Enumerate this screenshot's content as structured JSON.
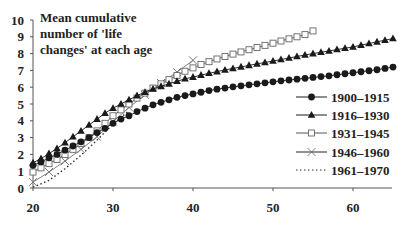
{
  "chart_data": {
    "type": "line",
    "title": "Mean cumulative number of 'life changes' at each age",
    "title_lines": [
      "Mean cumulative",
      "number of 'life",
      "changes' at each age"
    ],
    "xlabel": "",
    "ylabel": "",
    "xlim": [
      20,
      65
    ],
    "ylim": [
      0,
      10
    ],
    "x_ticks": [
      20,
      30,
      40,
      50,
      60
    ],
    "y_ticks": [
      0,
      1,
      2,
      3,
      4,
      5,
      6,
      7,
      8,
      9,
      10
    ],
    "grid": false,
    "legend_position": "right-middle",
    "series": [
      {
        "name": "1900–1915",
        "marker": "filled-circle",
        "color": "#1a1a1a",
        "x": [
          20,
          21,
          22,
          23,
          24,
          25,
          26,
          27,
          28,
          29,
          30,
          31,
          32,
          33,
          34,
          35,
          36,
          37,
          38,
          39,
          40,
          41,
          42,
          43,
          44,
          45,
          46,
          47,
          48,
          49,
          50,
          51,
          52,
          53,
          54,
          55,
          56,
          57,
          58,
          59,
          60,
          61,
          62,
          63,
          64,
          65
        ],
        "values": [
          1.35,
          1.55,
          1.8,
          2.0,
          2.25,
          2.5,
          2.75,
          3.0,
          3.3,
          3.55,
          3.85,
          4.1,
          4.3,
          4.55,
          4.75,
          4.95,
          5.1,
          5.25,
          5.4,
          5.5,
          5.6,
          5.7,
          5.8,
          5.88,
          5.95,
          6.02,
          6.08,
          6.14,
          6.2,
          6.26,
          6.32,
          6.38,
          6.43,
          6.48,
          6.53,
          6.58,
          6.63,
          6.68,
          6.74,
          6.8,
          6.86,
          6.92,
          6.98,
          7.04,
          7.12,
          7.2
        ]
      },
      {
        "name": "1916–1930",
        "marker": "filled-triangle",
        "color": "#1a1a1a",
        "x": [
          20,
          21,
          22,
          23,
          24,
          25,
          26,
          27,
          28,
          29,
          30,
          31,
          32,
          33,
          34,
          35,
          36,
          37,
          38,
          39,
          40,
          41,
          42,
          43,
          44,
          45,
          46,
          47,
          48,
          49,
          50,
          51,
          52,
          53,
          54,
          55,
          56,
          57,
          58,
          59,
          60,
          61,
          62,
          63,
          64,
          65
        ],
        "values": [
          1.5,
          1.75,
          2.05,
          2.35,
          2.7,
          3.05,
          3.4,
          3.75,
          4.1,
          4.45,
          4.75,
          5.0,
          5.25,
          5.5,
          5.7,
          5.9,
          6.05,
          6.2,
          6.35,
          6.5,
          6.6,
          6.72,
          6.83,
          6.93,
          7.03,
          7.12,
          7.21,
          7.3,
          7.39,
          7.47,
          7.56,
          7.65,
          7.74,
          7.83,
          7.92,
          8.0,
          8.08,
          8.16,
          8.24,
          8.32,
          8.4,
          8.5,
          8.6,
          8.7,
          8.8,
          8.9
        ]
      },
      {
        "name": "1931–1945",
        "marker": "open-square",
        "color": "#555555",
        "x": [
          20,
          21,
          22,
          23,
          24,
          25,
          26,
          27,
          28,
          29,
          30,
          31,
          32,
          33,
          34,
          35,
          36,
          37,
          38,
          39,
          40,
          41,
          42,
          43,
          44,
          45,
          46,
          47,
          48,
          49,
          50,
          51,
          52,
          53,
          54,
          55
        ],
        "values": [
          0.95,
          1.2,
          1.45,
          1.7,
          2.0,
          2.3,
          2.65,
          3.0,
          3.4,
          3.85,
          4.3,
          4.65,
          5.0,
          5.35,
          5.65,
          5.95,
          6.2,
          6.45,
          6.7,
          6.95,
          7.15,
          7.35,
          7.52,
          7.68,
          7.83,
          7.97,
          8.1,
          8.23,
          8.36,
          8.49,
          8.62,
          8.75,
          8.88,
          9.0,
          9.13,
          9.35
        ]
      },
      {
        "name": "1946–1960",
        "marker": "cross",
        "color": "#777777",
        "x": [
          20,
          22,
          24,
          26,
          28,
          30,
          32,
          34,
          36,
          38,
          40
        ],
        "values": [
          0.35,
          0.95,
          1.6,
          2.3,
          3.05,
          3.95,
          4.8,
          5.55,
          6.25,
          6.9,
          7.6
        ]
      },
      {
        "name": "1961–1970",
        "marker": "none",
        "line_style": "dotted",
        "color": "#333333",
        "x": [
          20,
          22,
          24,
          26,
          28,
          30,
          32
        ],
        "values": [
          0.05,
          0.45,
          1.15,
          1.95,
          2.85,
          3.8,
          4.6
        ]
      }
    ]
  }
}
